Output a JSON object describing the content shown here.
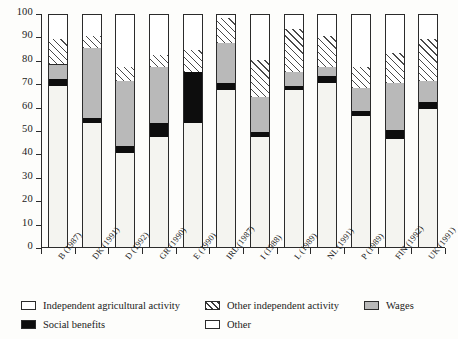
{
  "chart_data": {
    "type": "bar",
    "title": "",
    "subtitle": "",
    "xlabel": "",
    "ylabel": "",
    "stacked": true,
    "stack_order_bottom_to_top": [
      "Independent agricultural activity",
      "Social benefits",
      "Wages",
      "Other independent activity",
      "Other"
    ],
    "ylim": [
      0,
      100
    ],
    "yticks": [
      0,
      10,
      20,
      30,
      40,
      50,
      60,
      70,
      80,
      90,
      100
    ],
    "ytick_labels": [
      "0",
      "10",
      "20",
      "30",
      "40",
      "50",
      "60",
      "70",
      "80",
      "90",
      "100"
    ],
    "grid": false,
    "legend_position": "bottom",
    "categories": [
      "B (1987)",
      "DK (1991)",
      "D (1992)",
      "GR (1990)",
      "E (1990)",
      "IRL (1987)",
      "I (1988)",
      "L (1989)",
      "NL (1991)",
      "P (1989)",
      "FIN (1992)",
      "UK (1991)"
    ],
    "series": [
      {
        "name": "Independent agricultural activity",
        "color": "#f4f4f0",
        "pattern": "solid-pale",
        "values": [
          69,
          53,
          40,
          47,
          53,
          67,
          47,
          67,
          70,
          56,
          46,
          59
        ]
      },
      {
        "name": "Social benefits",
        "color": "#0d0d0d",
        "pattern": "solid-black",
        "values": [
          3,
          2,
          3,
          6,
          22,
          3,
          2,
          2,
          3,
          2,
          4,
          3
        ]
      },
      {
        "name": "Wages",
        "color": "#b9b9b9",
        "pattern": "solid-gray",
        "values": [
          6,
          30,
          28,
          24,
          0,
          17,
          15,
          6,
          4,
          10,
          20,
          9
        ]
      },
      {
        "name": "Other independent activity",
        "color": "#ffffff",
        "pattern": "diagonal-hatch",
        "values": [
          11,
          5,
          6,
          5,
          9,
          11,
          16,
          18,
          13,
          9,
          13,
          18
        ]
      },
      {
        "name": "Other",
        "color": "#ffffff",
        "pattern": "solid-white",
        "values": [
          11,
          10,
          23,
          18,
          16,
          2,
          20,
          7,
          10,
          23,
          17,
          11
        ]
      }
    ]
  },
  "legend": {
    "items": [
      {
        "label": "Independent agricultural activity",
        "key": "indep-agri"
      },
      {
        "label": "Other independent activity",
        "key": "other-indep"
      },
      {
        "label": "Wages",
        "key": "wages"
      },
      {
        "label": "Social benefits",
        "key": "social"
      },
      {
        "label": "Other",
        "key": "other"
      }
    ]
  }
}
